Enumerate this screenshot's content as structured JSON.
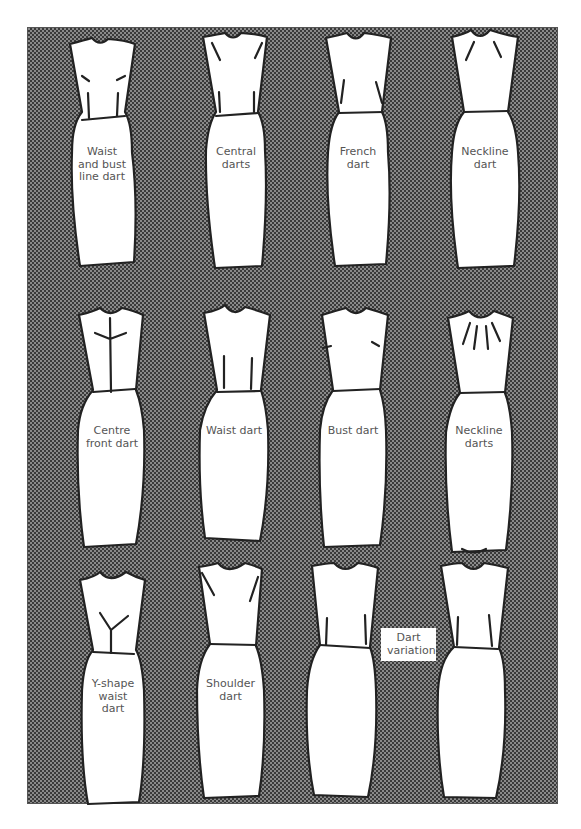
{
  "figure": {
    "title": "Dart variations",
    "background_colors": {
      "pattern_dark": "#3a3a3a",
      "pattern_light": "#8a8a8a",
      "dress_fill": "#ffffff",
      "outline": "#222222",
      "label_text": "#555555"
    }
  },
  "dresses": [
    {
      "row": 1,
      "col": 1,
      "label": "Waist\nand bust\nline dart"
    },
    {
      "row": 1,
      "col": 2,
      "label": "Central\ndarts"
    },
    {
      "row": 1,
      "col": 3,
      "label": "French\ndart"
    },
    {
      "row": 1,
      "col": 4,
      "label": "Neckline\ndart"
    },
    {
      "row": 2,
      "col": 1,
      "label": "Centre\nfront dart"
    },
    {
      "row": 2,
      "col": 2,
      "label": "Waist dart"
    },
    {
      "row": 2,
      "col": 3,
      "label": "Bust dart"
    },
    {
      "row": 2,
      "col": 4,
      "label": "Neckline\ndarts"
    },
    {
      "row": 3,
      "col": 1,
      "label": "Y-shape\nwaist\ndart"
    },
    {
      "row": 3,
      "col": 2,
      "label": "Shoulder\ndart"
    },
    {
      "row": 3,
      "col": 3,
      "label": ""
    },
    {
      "row": 3,
      "col": 4,
      "label": ""
    }
  ],
  "caption_box": {
    "label": "Dart\nvariations"
  }
}
